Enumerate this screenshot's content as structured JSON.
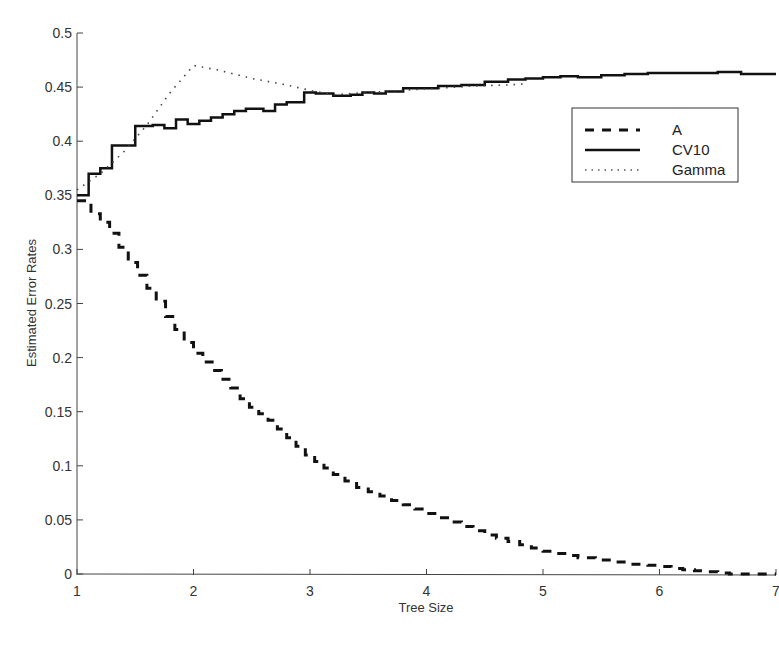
{
  "chart_data": {
    "type": "line",
    "title": "",
    "xlabel": "Tree Size",
    "ylabel": "Estimated Error Rates",
    "xlim": [
      1,
      7
    ],
    "ylim": [
      0,
      0.5
    ],
    "grid": false,
    "legend_position": "upper right",
    "x_ticks": [
      1,
      2,
      3,
      4,
      5,
      6,
      7
    ],
    "x_tick_labels": [
      "1",
      "2",
      "3",
      "4",
      "5",
      "6",
      "7"
    ],
    "y_ticks": [
      0,
      0.05,
      0.1,
      0.15,
      0.2,
      0.25,
      0.3,
      0.35,
      0.4,
      0.45,
      0.5
    ],
    "y_tick_labels": [
      "0",
      "0.05",
      "0.1",
      "0.15",
      "0.2",
      "0.25",
      "0.3",
      "0.35",
      "0.4",
      "0.45",
      "0.5"
    ],
    "series": [
      {
        "name": "A",
        "style": "dashed",
        "step": true,
        "color": "#111111",
        "x": [
          1.0,
          1.05,
          1.12,
          1.2,
          1.28,
          1.36,
          1.44,
          1.52,
          1.6,
          1.68,
          1.76,
          1.84,
          1.92,
          2.0,
          2.08,
          2.16,
          2.24,
          2.32,
          2.4,
          2.48,
          2.56,
          2.64,
          2.72,
          2.8,
          2.88,
          2.96,
          3.04,
          3.12,
          3.2,
          3.3,
          3.4,
          3.5,
          3.6,
          3.7,
          3.8,
          3.9,
          4.0,
          4.1,
          4.2,
          4.3,
          4.4,
          4.5,
          4.6,
          4.7,
          4.8,
          4.9,
          5.0,
          5.1,
          5.2,
          5.3,
          5.45,
          5.6,
          5.75,
          5.9,
          6.0,
          6.1,
          6.2,
          6.3,
          6.4,
          6.5,
          6.6,
          6.75,
          6.9,
          7.0
        ],
        "values": [
          0.345,
          0.345,
          0.333,
          0.325,
          0.315,
          0.302,
          0.288,
          0.276,
          0.264,
          0.252,
          0.238,
          0.226,
          0.214,
          0.204,
          0.196,
          0.188,
          0.18,
          0.172,
          0.162,
          0.154,
          0.148,
          0.142,
          0.134,
          0.126,
          0.118,
          0.11,
          0.104,
          0.098,
          0.092,
          0.086,
          0.08,
          0.076,
          0.072,
          0.068,
          0.064,
          0.06,
          0.056,
          0.052,
          0.048,
          0.044,
          0.04,
          0.036,
          0.033,
          0.03,
          0.027,
          0.024,
          0.021,
          0.019,
          0.017,
          0.015,
          0.013,
          0.011,
          0.009,
          0.008,
          0.007,
          0.005,
          0.004,
          0.003,
          0.002,
          0.001,
          0.0,
          0.0,
          0.0,
          0.0
        ]
      },
      {
        "name": "CV10",
        "style": "solid",
        "step": true,
        "color": "#111111",
        "x": [
          1.0,
          1.1,
          1.2,
          1.3,
          1.5,
          1.65,
          1.75,
          1.85,
          1.95,
          2.05,
          2.15,
          2.25,
          2.35,
          2.45,
          2.6,
          2.7,
          2.8,
          2.95,
          3.05,
          3.2,
          3.35,
          3.45,
          3.55,
          3.65,
          3.8,
          4.1,
          4.3,
          4.5,
          4.7,
          4.85,
          5.0,
          5.15,
          5.3,
          5.5,
          5.7,
          5.9,
          6.1,
          6.3,
          6.5,
          6.7,
          7.0
        ],
        "values": [
          0.35,
          0.37,
          0.375,
          0.396,
          0.414,
          0.415,
          0.412,
          0.42,
          0.416,
          0.419,
          0.422,
          0.425,
          0.428,
          0.43,
          0.428,
          0.434,
          0.436,
          0.445,
          0.444,
          0.442,
          0.443,
          0.445,
          0.444,
          0.446,
          0.449,
          0.451,
          0.452,
          0.455,
          0.457,
          0.458,
          0.459,
          0.46,
          0.459,
          0.461,
          0.462,
          0.463,
          0.463,
          0.463,
          0.464,
          0.462,
          0.462
        ]
      },
      {
        "name": "Gamma",
        "style": "dotted",
        "step": false,
        "color": "#444444",
        "x": [
          1.0,
          1.2,
          1.4,
          1.6,
          1.8,
          2.0,
          2.2,
          2.5,
          2.8,
          3.0,
          3.2,
          3.5,
          3.8,
          4.1,
          4.4,
          4.7,
          4.85
        ],
        "values": [
          0.355,
          0.37,
          0.39,
          0.415,
          0.445,
          0.47,
          0.466,
          0.458,
          0.452,
          0.447,
          0.443,
          0.445,
          0.447,
          0.449,
          0.451,
          0.452,
          0.453
        ]
      }
    ]
  },
  "legend": {
    "items": [
      {
        "label": "A",
        "style": "dashed"
      },
      {
        "label": "CV10",
        "style": "solid"
      },
      {
        "label": "Gamma",
        "style": "dotted"
      }
    ]
  },
  "axes": {
    "xlabel": "Tree Size",
    "ylabel": "Estimated Error Rates"
  }
}
